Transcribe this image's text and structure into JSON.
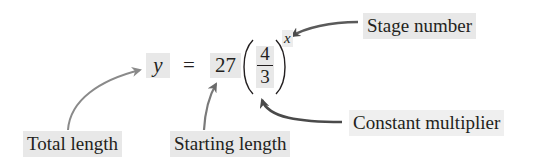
{
  "equation": {
    "lhs": "y",
    "equals": "=",
    "coefficient": "27",
    "fraction": {
      "numerator": "4",
      "denominator": "3"
    },
    "exponent": "x"
  },
  "labels": {
    "stage_number": "Stage number",
    "total_length": "Total length",
    "starting_length": "Starting length",
    "constant_multiplier": "Constant multiplier"
  },
  "colors": {
    "text": "#231f20",
    "highlight": "#e8e8e8",
    "arrow_light": "#8a8a8a",
    "arrow_dark": "#4a4a4a"
  }
}
